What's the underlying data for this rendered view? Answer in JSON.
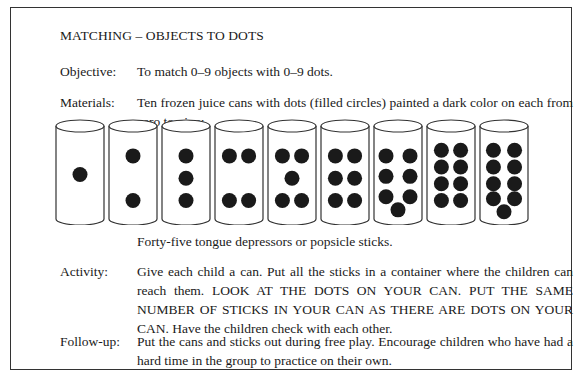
{
  "title": "MATCHING – OBJECTS TO DOTS",
  "sections": {
    "objective": {
      "label": "Objective:",
      "text": "To match 0–9 objects with 0–9 dots."
    },
    "materials": {
      "label": "Materials:",
      "text": "Ten frozen juice cans with dots (filled circles) painted a dark color on each from zero to nine:",
      "extra": "Forty-five tongue depressors or popsicle sticks."
    },
    "activity": {
      "label": "Activity:",
      "text": "Give each child a can.  Put all the sticks in a container where the children can reach them.  LOOK AT THE DOTS ON YOUR CAN.  PUT THE SAME NUMBER OF STICKS IN YOUR CAN AS THERE ARE DOTS ON YOUR CAN.  Have the children check with each other."
    },
    "followup": {
      "label": "Follow-up:",
      "text": "Put the cans and sticks out during free play.  Encourage children who have had a hard time in the group to practice on their own."
    }
  },
  "illustration": {
    "description": "cans-with-dots",
    "can_dot_counts": [
      1,
      2,
      3,
      4,
      5,
      6,
      7,
      8,
      9
    ],
    "dot_color": "#1a1a1a",
    "outline_color": "#333333"
  }
}
